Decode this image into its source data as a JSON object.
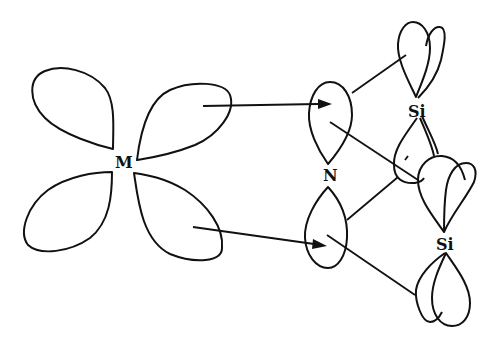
{
  "diagram": {
    "labels": {
      "metal": "M",
      "nitrogen": "N",
      "silicon_top": "Si",
      "silicon_bottom": "Si"
    },
    "nodes": [
      {
        "id": "M",
        "label": "M",
        "type": "d-orbital (4 lobes)"
      },
      {
        "id": "N",
        "label": "N",
        "type": "p-orbital (2 lobes)"
      },
      {
        "id": "Si1",
        "label": "Si",
        "type": "orbital pair (upper)"
      },
      {
        "id": "Si2",
        "label": "Si",
        "type": "orbital pair (lower)"
      }
    ],
    "edges": [
      {
        "from": "M upper-right lobe",
        "to": "N upper lobe",
        "style": "arrow"
      },
      {
        "from": "M lower-right lobe",
        "to": "N lower lobe",
        "style": "arrow"
      },
      {
        "from": "N upper lobe",
        "to": "Si1 upper lobe",
        "style": "line"
      },
      {
        "from": "N upper lobe",
        "to": "Si2 upper lobe",
        "style": "line"
      },
      {
        "from": "N lower lobe",
        "to": "Si1 lower lobe",
        "style": "line"
      },
      {
        "from": "N lower lobe",
        "to": "Si2 lower lobe",
        "style": "line"
      }
    ],
    "colors": {
      "stroke": "#111111",
      "background": "#ffffff"
    }
  }
}
